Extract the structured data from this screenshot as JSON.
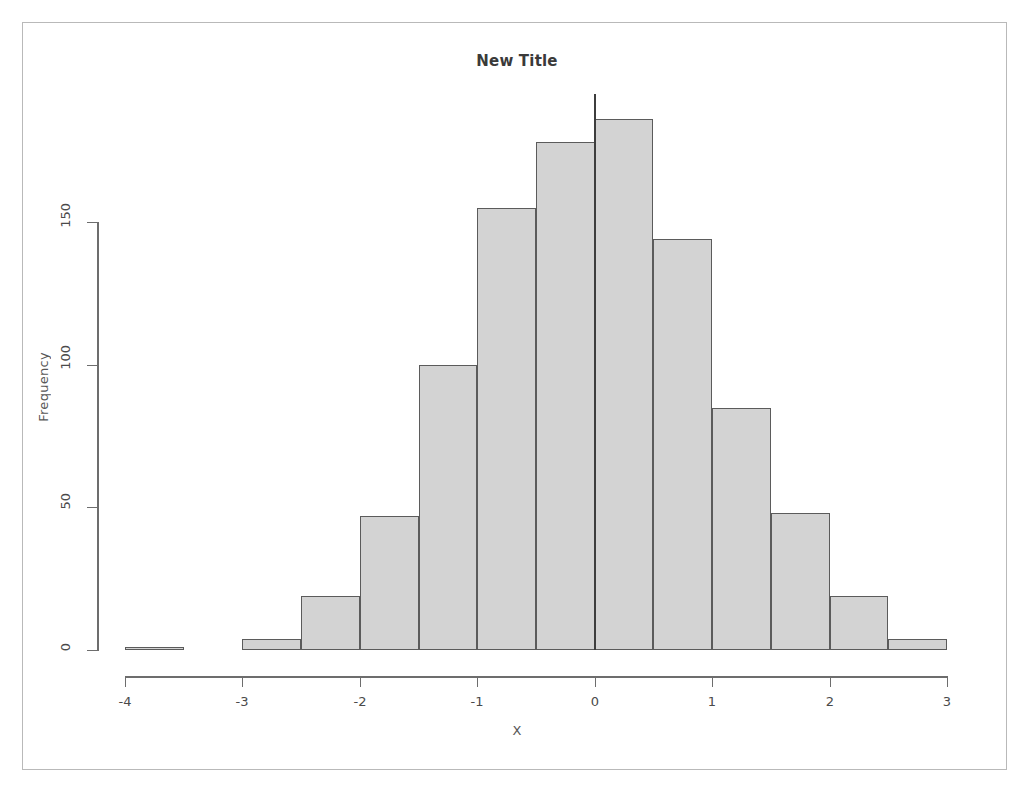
{
  "chart_data": {
    "type": "bar",
    "subtype": "histogram",
    "title": "New Title",
    "xlabel": "X",
    "ylabel": "Frequency",
    "xlim": [
      -4,
      3
    ],
    "ylim": [
      0,
      190
    ],
    "binwidth": 0.5,
    "grid": false,
    "legend": null,
    "x_ticks": [
      "-4",
      "-3",
      "-2",
      "-1",
      "0",
      "1",
      "2",
      "3"
    ],
    "x_tick_values": [
      -4,
      -3,
      -2,
      -1,
      0,
      1,
      2,
      3
    ],
    "y_ticks": [
      "0",
      "50",
      "100",
      "150"
    ],
    "y_tick_values": [
      0,
      50,
      100,
      150
    ],
    "bin_edges": [
      -4,
      -3.5,
      -3,
      -2.5,
      -2,
      -1.5,
      -1,
      -0.5,
      0,
      0.5,
      1,
      1.5,
      2,
      2.5,
      3
    ],
    "bin_labels": [
      "-4 to -3.5",
      "-3.5 to -3",
      "-3 to -2.5",
      "-2.5 to -2",
      "-2 to -1.5",
      "-1.5 to -1",
      "-1 to -0.5",
      "-0.5 to 0",
      "0 to 0.5",
      "0.5 to 1",
      "1 to 1.5",
      "1.5 to 2",
      "2 to 2.5",
      "2.5 to 3"
    ],
    "values": [
      1,
      0,
      4,
      19,
      47,
      100,
      155,
      178,
      186,
      144,
      85,
      48,
      19,
      4
    ],
    "bar_fill_color": "#d3d3d3",
    "bar_border_color": "#5b5b5b",
    "annotations": [
      {
        "name": "vertical-reference-line",
        "x": 0,
        "color": "#3d3d3d",
        "label": ""
      }
    ]
  }
}
